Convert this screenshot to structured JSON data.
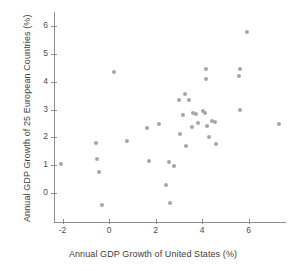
{
  "chart_data": {
    "type": "scatter",
    "title": "",
    "xlabel": "Annual GDP Growth of United States (%)",
    "ylabel": "Annual GDP Growth of 25 European Countries (%)",
    "xlim": [
      -2.6,
      7.7
    ],
    "ylim": [
      -1.0,
      6.4
    ],
    "grid": false,
    "legend": null,
    "xticks": [
      -2,
      0,
      2,
      4,
      6
    ],
    "xticklabels": [
      "-2",
      "0",
      "2",
      "4",
      "6"
    ],
    "yticks": [
      0,
      1,
      2,
      3,
      4,
      5,
      6
    ],
    "yticklabels": [
      "0",
      "1",
      "2",
      "3",
      "4",
      "5",
      "6"
    ],
    "marker": "circle",
    "marker_color": "#a6a6a6",
    "axis_color": "#8f8f8f",
    "points": [
      {
        "x": -2.06,
        "y": 1.05
      },
      {
        "x": -0.56,
        "y": 1.78
      },
      {
        "x": -0.5,
        "y": 1.22
      },
      {
        "x": -0.45,
        "y": 0.75
      },
      {
        "x": -0.32,
        "y": -0.44
      },
      {
        "x": 0.23,
        "y": 4.34
      },
      {
        "x": 0.78,
        "y": 1.88
      },
      {
        "x": 1.64,
        "y": 2.34
      },
      {
        "x": 1.7,
        "y": 1.16
      },
      {
        "x": 2.15,
        "y": 2.48
      },
      {
        "x": 2.44,
        "y": 0.28
      },
      {
        "x": 2.56,
        "y": 1.1
      },
      {
        "x": 2.62,
        "y": -0.36
      },
      {
        "x": 2.78,
        "y": 0.97
      },
      {
        "x": 3.03,
        "y": 3.33
      },
      {
        "x": 3.06,
        "y": 2.11
      },
      {
        "x": 3.2,
        "y": 2.82
      },
      {
        "x": 3.26,
        "y": 3.57
      },
      {
        "x": 3.3,
        "y": 1.7
      },
      {
        "x": 3.42,
        "y": 3.34
      },
      {
        "x": 3.56,
        "y": 2.37
      },
      {
        "x": 3.6,
        "y": 2.86
      },
      {
        "x": 3.76,
        "y": 2.84
      },
      {
        "x": 3.83,
        "y": 2.52
      },
      {
        "x": 4.06,
        "y": 2.96
      },
      {
        "x": 4.12,
        "y": 2.88
      },
      {
        "x": 4.16,
        "y": 4.11
      },
      {
        "x": 4.19,
        "y": 4.47
      },
      {
        "x": 4.22,
        "y": 2.4
      },
      {
        "x": 4.28,
        "y": 2.02
      },
      {
        "x": 4.42,
        "y": 2.6
      },
      {
        "x": 4.56,
        "y": 2.56
      },
      {
        "x": 4.6,
        "y": 1.76
      },
      {
        "x": 5.58,
        "y": 4.22
      },
      {
        "x": 5.62,
        "y": 4.44
      },
      {
        "x": 5.65,
        "y": 2.97
      },
      {
        "x": 5.92,
        "y": 5.78
      },
      {
        "x": 7.3,
        "y": 2.48
      }
    ]
  }
}
